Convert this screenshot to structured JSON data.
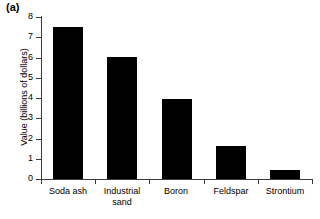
{
  "panel": {
    "label": "(a)"
  },
  "chart_data": {
    "type": "bar",
    "title": "",
    "xlabel": "",
    "ylabel": "Value (billions of dollars)",
    "categories": [
      "Soda ash",
      "Industrial sand",
      "Boron",
      "Feldspar",
      "Strontium"
    ],
    "category_lines": [
      [
        "Soda ash"
      ],
      [
        "Industrial",
        "sand"
      ],
      [
        "Boron"
      ],
      [
        "Feldspar"
      ],
      [
        "Strontium"
      ]
    ],
    "values": [
      7.5,
      6.0,
      3.95,
      1.65,
      0.45
    ],
    "ylim": [
      0,
      8
    ],
    "ytick_values": [
      0,
      1,
      2,
      3,
      4,
      5,
      6,
      7,
      8
    ],
    "ytick_labels": [
      "0",
      "1",
      "2",
      "3",
      "4",
      "5",
      "6",
      "7",
      "8"
    ],
    "grid": false,
    "legend": null,
    "bar_color": "#000000",
    "axis_color": "#3a3a3a"
  }
}
